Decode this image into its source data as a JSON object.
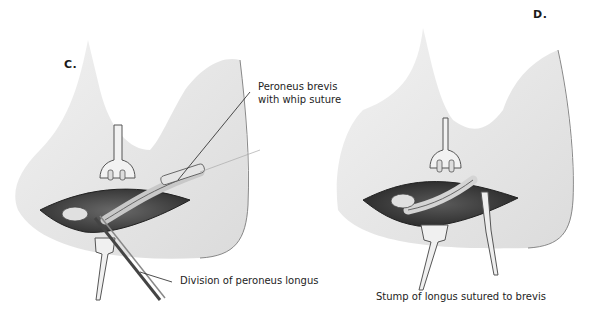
{
  "figure": {
    "panels": [
      {
        "id": "C",
        "letter": "C.",
        "labels": [
          {
            "line1": "Peroneus brevis",
            "line2": "with whip suture"
          },
          {
            "line1": "Division of peroneus longus"
          }
        ]
      },
      {
        "id": "D",
        "letter": "D.",
        "labels": [
          {
            "line1": "Stump of longus sutured to brevis"
          }
        ]
      }
    ]
  },
  "colors": {
    "skin_shade": "#d9d9d9",
    "wound_dark": "#4a4a4a",
    "tendon": "#bdbdbd",
    "line": "#222222"
  }
}
